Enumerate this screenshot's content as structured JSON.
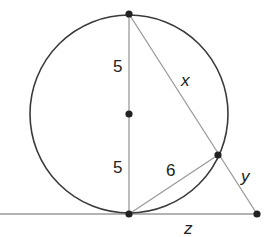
{
  "diagram": {
    "type": "geometry-circle-secant-tangent",
    "colors": {
      "circle_stroke": "#3a3a3a",
      "line_stroke": "#9a9a9a",
      "point_fill": "#222222",
      "label_color": "#222222",
      "background": "#ffffff"
    },
    "circle": {
      "center": [
        129,
        114
      ],
      "radius": 99
    },
    "points": [
      {
        "id": "top",
        "x": 129,
        "y": 14
      },
      {
        "id": "center",
        "x": 129,
        "y": 114
      },
      {
        "id": "bottom",
        "x": 129,
        "y": 214
      },
      {
        "id": "chord-end",
        "x": 218,
        "y": 155
      },
      {
        "id": "external",
        "x": 257,
        "y": 214
      }
    ],
    "segments": [
      {
        "id": "diameter",
        "from": "top",
        "to": "bottom"
      },
      {
        "id": "secant",
        "from": "top",
        "to": "external"
      },
      {
        "id": "chord",
        "from": "bottom",
        "to": "chord-end"
      },
      {
        "id": "tangent",
        "from": [
          0,
          214
        ],
        "to": "external"
      }
    ],
    "labels": {
      "upper_radius": "5",
      "lower_radius": "5",
      "chord": "6",
      "secant_inner": "x",
      "secant_outer": "y",
      "tangent": "z"
    }
  }
}
